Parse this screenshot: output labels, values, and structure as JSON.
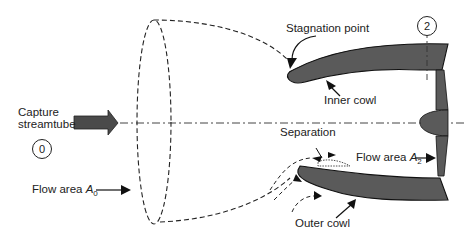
{
  "diagram": {
    "labels": {
      "stagnation_point": "Stagnation point",
      "inner_cowl": "Inner cowl",
      "capture_line1": "Capture",
      "capture_line2": "streamtube",
      "separation": "Separation",
      "flow_area_a2_prefix": "Flow area ",
      "flow_area_a2_symbol": "A",
      "flow_area_a2_sub": "2",
      "flow_area_a0_prefix": "Flow area ",
      "flow_area_a0_symbol": "A",
      "flow_area_a0_sub": "0",
      "outer_cowl": "Outer cowl"
    },
    "stations": {
      "station_0": "0",
      "station_2": "2"
    },
    "colors": {
      "cowl_fill": "#5a5a5a",
      "line": "#1a1a1a",
      "arrow_fill": "#4a4a4a",
      "background": "#ffffff"
    }
  }
}
